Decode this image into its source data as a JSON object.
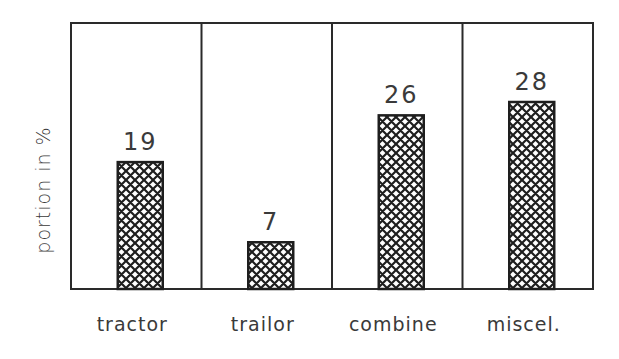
{
  "chart_data": {
    "type": "bar",
    "title": "",
    "xlabel": "",
    "ylabel": "portion in %",
    "categories": [
      "tractor",
      "trailor",
      "combine",
      "miscel."
    ],
    "values": [
      19,
      7,
      26,
      28
    ],
    "value_labels": [
      "19",
      "7",
      "26",
      "28"
    ],
    "ylim": [
      0,
      35
    ],
    "grid": false,
    "legend": null,
    "bar_pattern": "crosshatch",
    "panel_dividers": true
  },
  "colors": {
    "frame": "#2a2a2a",
    "bar_fill": "#1e1e1e",
    "background": "#ffffff"
  }
}
